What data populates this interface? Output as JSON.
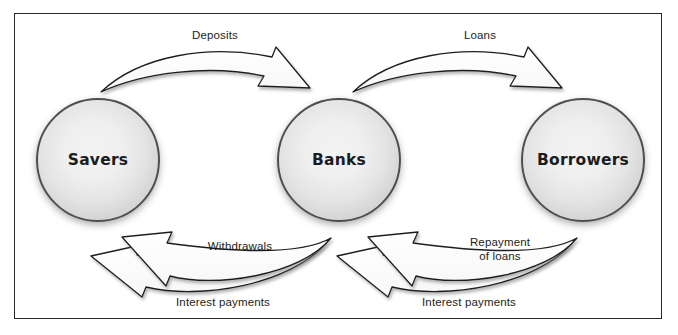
{
  "diagram": {
    "frame_color": "#23282b",
    "background": "#ffffff",
    "nodes": [
      {
        "id": "savers",
        "label": "Savers",
        "cx": 98,
        "cy": 160,
        "r": 62
      },
      {
        "id": "banks",
        "label": "Banks",
        "cx": 339,
        "cy": 160,
        "r": 62
      },
      {
        "id": "borrowers",
        "label": "Borrowers",
        "cx": 583,
        "cy": 160,
        "r": 62
      }
    ],
    "flows": [
      {
        "id": "deposits",
        "label": "Deposits",
        "from": "savers",
        "to": "banks",
        "direction": "right",
        "position": "top"
      },
      {
        "id": "loans",
        "label": "Loans",
        "from": "banks",
        "to": "borrowers",
        "direction": "right",
        "position": "top"
      },
      {
        "id": "withdrawals",
        "label": "Withdrawals",
        "from": "banks",
        "to": "savers",
        "direction": "left",
        "position": "bottom"
      },
      {
        "id": "interest-left",
        "label": "Interest payments",
        "from": "banks",
        "to": "savers",
        "direction": "left",
        "position": "bottom"
      },
      {
        "id": "repayment-of-loans",
        "label": "Repayment\nof loans",
        "from": "borrowers",
        "to": "banks",
        "direction": "left",
        "position": "bottom"
      },
      {
        "id": "interest-right",
        "label": "Interest payments",
        "from": "borrowers",
        "to": "banks",
        "direction": "left",
        "position": "bottom"
      }
    ]
  }
}
